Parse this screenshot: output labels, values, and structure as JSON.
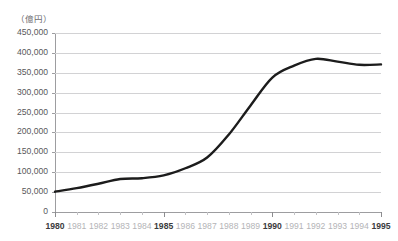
{
  "chart_data": {
    "type": "line",
    "title": "",
    "subtitle": "",
    "unit_label": "（億円）",
    "xlabel": "",
    "ylabel": "",
    "grid": true,
    "legend": "none",
    "xlim": [
      1980,
      1995
    ],
    "ylim": [
      0,
      450000
    ],
    "y_ticks": [
      0,
      50000,
      100000,
      150000,
      200000,
      250000,
      300000,
      350000,
      400000,
      450000
    ],
    "y_tick_labels": [
      "0",
      "50,000",
      "100,000",
      "150,000",
      "200,000",
      "250,000",
      "300,000",
      "350,000",
      "400,000",
      "450,000"
    ],
    "x_ticks": [
      1980,
      1981,
      1982,
      1983,
      1984,
      1985,
      1986,
      1987,
      1988,
      1989,
      1990,
      1991,
      1992,
      1993,
      1994,
      1995
    ],
    "x_tick_labels": [
      "1980",
      "1981",
      "1982",
      "1983",
      "1984",
      "1985",
      "1986",
      "1987",
      "1988",
      "1989",
      "1990",
      "1991",
      "1992",
      "1993",
      "1994",
      "1995"
    ],
    "x_major_ticks": [
      1980,
      1985,
      1990,
      1995
    ],
    "categories": [
      1980,
      1981,
      1982,
      1983,
      1984,
      1985,
      1986,
      1987,
      1988,
      1989,
      1990,
      1991,
      1992,
      1993,
      1994,
      1995
    ],
    "values": [
      51000,
      60000,
      71000,
      83000,
      85000,
      92000,
      110000,
      137000,
      195000,
      268000,
      338000,
      368000,
      385000,
      378000,
      370000,
      371000
    ],
    "series": [
      {
        "name": "",
        "color": "#1c1c1c",
        "line_width": 2.4,
        "values": [
          51000,
          60000,
          71000,
          83000,
          85000,
          92000,
          110000,
          137000,
          195000,
          268000,
          338000,
          368000,
          385000,
          378000,
          370000,
          371000
        ]
      }
    ],
    "colors": {
      "line": "#1c1c1c",
      "gridline": "#d2d2d4",
      "axis": "#9d9da0",
      "tick_label": "#58585a",
      "tick_label_minor": "#b4b4b7",
      "background": "#ffffff"
    }
  }
}
